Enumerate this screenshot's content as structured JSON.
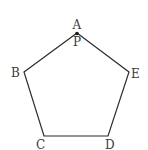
{
  "diagram": {
    "type": "regular-pentagon",
    "stroke_color": "#2b2b2b",
    "label_color": "#3a3a3a",
    "vertices": [
      {
        "label": "A",
        "x": 77,
        "y": 33
      },
      {
        "label": "B",
        "x": 24,
        "y": 72
      },
      {
        "label": "C",
        "x": 44,
        "y": 136
      },
      {
        "label": "D",
        "x": 108,
        "y": 136
      },
      {
        "label": "E",
        "x": 129,
        "y": 72
      }
    ],
    "point": {
      "label": "P",
      "x": 77,
      "y": 33
    },
    "labels": {
      "A": "A",
      "B": "B",
      "C": "C",
      "D": "D",
      "E": "E",
      "P": "P"
    }
  }
}
